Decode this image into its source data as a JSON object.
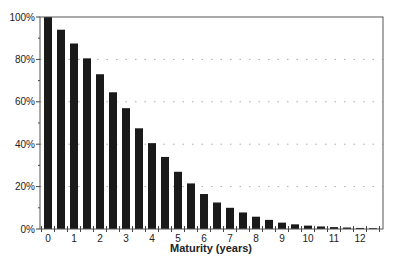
{
  "chart_data": {
    "type": "bar",
    "title": "",
    "xlabel": "Maturity (years)",
    "ylabel": "",
    "categories": [
      0,
      0.5,
      1,
      1.5,
      2,
      2.5,
      3,
      3.5,
      4,
      4.5,
      5,
      5.5,
      6,
      6.5,
      7,
      7.5,
      8,
      8.5,
      9,
      9.5,
      10,
      10.5,
      11,
      11.5,
      12,
      12.5
    ],
    "values": [
      100,
      94,
      87.5,
      80.5,
      73,
      64.5,
      57,
      47.5,
      40.5,
      34,
      27,
      21.5,
      16.5,
      12.5,
      10,
      7.8,
      5.8,
      4.3,
      3,
      2.2,
      1.6,
      1.2,
      0.9,
      0.7,
      0.5,
      0.4
    ],
    "ylim": [
      0,
      100
    ],
    "yticks": [
      "0%",
      "20%",
      "40%",
      "60%",
      "80%",
      "100%"
    ],
    "ytick_values": [
      0,
      20,
      40,
      60,
      80,
      100
    ],
    "xticks": [
      "0",
      "1",
      "2",
      "3",
      "4",
      "5",
      "6",
      "7",
      "8",
      "9",
      "10",
      "11",
      "12"
    ],
    "xtick_values": [
      0,
      1,
      2,
      3,
      4,
      5,
      6,
      7,
      8,
      9,
      10,
      11,
      12
    ],
    "grid": {
      "y": true,
      "style": "dotted",
      "lines_at": [
        20,
        40,
        60,
        80
      ]
    },
    "legend": null,
    "bar_color": "#1a1a1a"
  }
}
